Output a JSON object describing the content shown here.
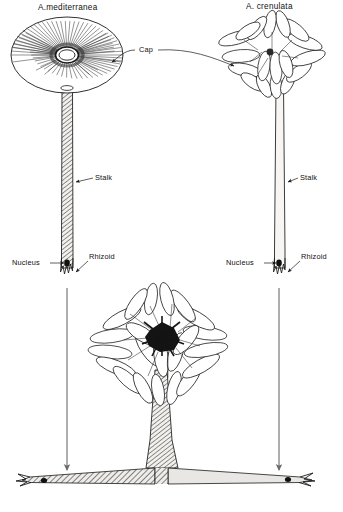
{
  "figure": {
    "name": "acetabularia-grafting-diagram",
    "background": "#ffffff",
    "ink_color": "#1a1a1a",
    "arrow_color": "#6b6b6b"
  },
  "specimens": [
    {
      "id": "a-mediterranea",
      "title": "A.mediterranea",
      "cap_style": "disc",
      "stalk_style": "hatched",
      "position": "top-left"
    },
    {
      "id": "a-crenulata",
      "title": "A. crenulata",
      "cap_style": "lobed-rays",
      "stalk_style": "plain",
      "position": "top-right"
    },
    {
      "id": "graft-hybrid",
      "title": "",
      "cap_style": "lobed-rays-dense",
      "stalk_style": "hatched",
      "position": "bottom-center"
    }
  ],
  "labels": {
    "cap": "Cap",
    "stalk_left": "Stalk",
    "stalk_right": "Stalk",
    "nucleus_left": "Nucleus",
    "nucleus_right": "Nucleus",
    "rhizoid_left": "Rhizoid",
    "rhizoid_right": "Rhizoid"
  },
  "arrows": {
    "left_descent": "arrow-down-left",
    "right_descent": "arrow-down-right",
    "cap_left": "arrow-to-left-cap",
    "cap_right": "arrow-to-right-cap"
  },
  "graft": {
    "left_segment": "hatched",
    "right_segment": "plain",
    "left_nucleus": true,
    "right_nucleus": true
  }
}
